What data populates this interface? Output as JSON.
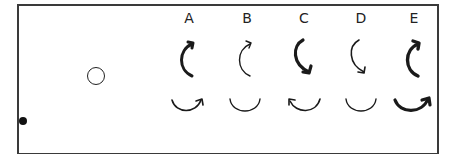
{
  "figure": {
    "objects": [
      {
        "name": "ball",
        "type": "filled-dot"
      },
      {
        "name": "ring",
        "type": "open-circle"
      }
    ],
    "options": [
      {
        "label": "A",
        "vertical_arrow": "counterclockwise-up",
        "vertical_weight": "bold",
        "horizontal_arrow": "right-arrowhead",
        "horizontal_weight": "thin"
      },
      {
        "label": "B",
        "vertical_arrow": "counterclockwise-up",
        "vertical_weight": "thin",
        "horizontal_arrow": "none",
        "horizontal_weight": "thin"
      },
      {
        "label": "C",
        "vertical_arrow": "down-arrowhead",
        "vertical_weight": "bold",
        "horizontal_arrow": "left-arrowhead",
        "horizontal_weight": "thin"
      },
      {
        "label": "D",
        "vertical_arrow": "down-arrowhead",
        "vertical_weight": "thin",
        "horizontal_arrow": "none",
        "horizontal_weight": "thin"
      },
      {
        "label": "E",
        "vertical_arrow": "counterclockwise-up",
        "vertical_weight": "bold",
        "horizontal_arrow": "right-arrowhead",
        "horizontal_weight": "bold"
      }
    ]
  },
  "colors": {
    "stroke": "#1a1a1a",
    "frame": "#3a3a3a",
    "background": "#ffffff"
  }
}
